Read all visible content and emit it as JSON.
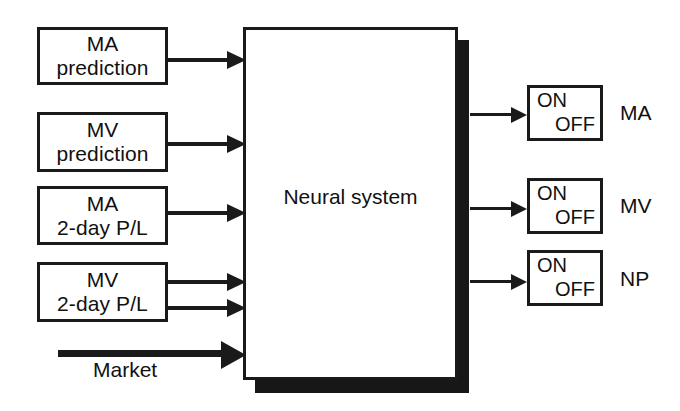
{
  "diagram": {
    "background_color": "#ffffff",
    "line_color": "#1a1a1a",
    "shadow_color": "#171717",
    "central_block": {
      "label": "Neural system"
    },
    "inputs": [
      {
        "line1": "MA",
        "line2": "prediction",
        "arrows": 1
      },
      {
        "line1": "MV",
        "line2": "prediction",
        "arrows": 1
      },
      {
        "line1": "MA",
        "line2": "2-day P/L",
        "arrows": 1
      },
      {
        "line1": "MV",
        "line2": "2-day P/L",
        "arrows": 2
      }
    ],
    "market_input": {
      "label": "Market"
    },
    "outputs": [
      {
        "state_on": "ON",
        "state_off": "OFF",
        "label": "MA"
      },
      {
        "state_on": "ON",
        "state_off": "OFF",
        "label": "MV"
      },
      {
        "state_on": "ON",
        "state_off": "OFF",
        "label": "NP"
      }
    ]
  }
}
